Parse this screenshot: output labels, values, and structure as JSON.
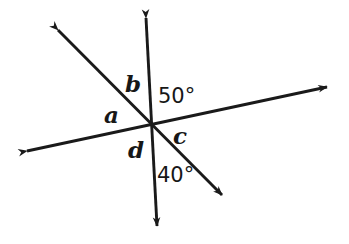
{
  "figure": {
    "background_color": "#ffffff",
    "stroke_color": "#1a1a1a",
    "text_color": "#171717",
    "width": 349,
    "height": 244
  },
  "intersection": {
    "x": 152,
    "y": 126,
    "label": "vertex"
  },
  "lines": [
    {
      "name": "vertical-line",
      "x1": 146,
      "y1": 18,
      "x2": 157,
      "y2": 226,
      "arrows": "both"
    },
    {
      "name": "transversal-line",
      "x1": 27,
      "y1": 151,
      "x2": 327,
      "y2": 87,
      "arrows": "both"
    },
    {
      "name": "diagonal-line",
      "x1": 58,
      "y1": 30,
      "x2": 222,
      "y2": 195,
      "arrows": "both"
    }
  ],
  "labels": {
    "b": {
      "text": "b",
      "x": 125,
      "y": 72,
      "kind": "variable"
    },
    "a": {
      "text": "a",
      "x": 104,
      "y": 103,
      "kind": "variable"
    },
    "d": {
      "text": "d",
      "x": 128,
      "y": 138,
      "kind": "variable"
    },
    "c": {
      "text": "c",
      "x": 173,
      "y": 124,
      "kind": "variable"
    },
    "fifty": {
      "text": "50°",
      "x": 158,
      "y": 86,
      "kind": "angle"
    },
    "forty": {
      "text": "40°",
      "x": 157,
      "y": 165,
      "kind": "angle"
    }
  },
  "angles": {
    "known": [
      {
        "name": "50-degree-angle",
        "value": 50,
        "unit": "degrees",
        "text": "50°"
      },
      {
        "name": "40-degree-angle",
        "value": 40,
        "unit": "degrees",
        "text": "40°"
      }
    ],
    "unknown": [
      {
        "name": "angle-a",
        "text": "a"
      },
      {
        "name": "angle-b",
        "text": "b"
      },
      {
        "name": "angle-c",
        "text": "c"
      },
      {
        "name": "angle-d",
        "text": "d"
      }
    ]
  }
}
